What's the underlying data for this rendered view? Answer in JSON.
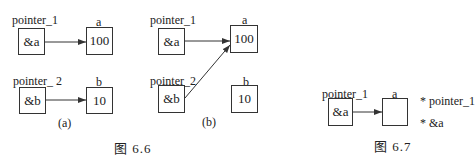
{
  "figure_6_6": {
    "caption": "图   6.6",
    "panel_a": {
      "label": "(a)",
      "pointer_1": {
        "name": "pointer_1",
        "value": "&a"
      },
      "var_a": {
        "name": "a",
        "value": "100"
      },
      "pointer_2": {
        "name": "pointer_ 2",
        "value": "&b"
      },
      "var_b": {
        "name": "b",
        "value": "10"
      }
    },
    "panel_b": {
      "label": "(b)",
      "pointer_1": {
        "name": "pointer_1",
        "value": "&a"
      },
      "var_a": {
        "name": "a",
        "value": "100"
      },
      "pointer_2": {
        "name": "pointer_2",
        "value": "&b"
      },
      "var_b": {
        "name": "b",
        "value": "10"
      }
    }
  },
  "figure_6_7": {
    "caption": "图   6.7",
    "pointer_1": {
      "name": "pointer_1",
      "value": "&a"
    },
    "var_a": {
      "name": "a",
      "value": ""
    },
    "notes": [
      "* pointer_1",
      "* &a"
    ]
  },
  "colors": {
    "line": "#333333",
    "background": "#ffffff"
  }
}
